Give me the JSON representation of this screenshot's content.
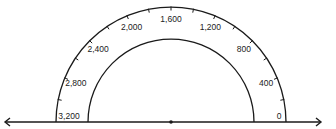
{
  "diagram": {
    "type": "semicircular-dial",
    "min": 0,
    "max": 3200,
    "direction": "counterclockwise from right",
    "tick_interval": 200,
    "label_interval": 400,
    "labels": [
      "0",
      "400",
      "800",
      "1,200",
      "1,600",
      "2,000",
      "2,400",
      "2,800",
      "3,200"
    ],
    "colors": {
      "stroke": "#1a1a1a",
      "text": "#222222",
      "background": "#ffffff"
    },
    "number_line": {
      "left_arrow": "arrow-left",
      "right_arrow": "arrow-right",
      "center_point": "dot"
    }
  }
}
